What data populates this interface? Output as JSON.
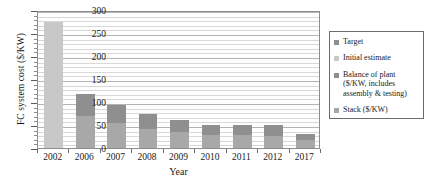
{
  "chart_data": {
    "type": "bar",
    "title": "",
    "xlabel": "Year",
    "ylabel": "FC system cost ($/KW)",
    "ylim": [
      0,
      300
    ],
    "yticks": [
      0,
      50,
      100,
      150,
      200,
      250,
      300
    ],
    "ytick_labels": [
      "0",
      "50",
      "100",
      "150",
      "200",
      "250",
      "300"
    ],
    "minor_tick_step": 10,
    "grid": true,
    "grid_axis": "y",
    "legend_position": "right",
    "stacked": true,
    "categories": [
      "2002",
      "2006",
      "2007",
      "2008",
      "2009",
      "2010",
      "2011",
      "2012",
      "2017"
    ],
    "series": [
      {
        "name": "Initial estimate",
        "color": "#c8c8c8",
        "values": [
          275,
          0,
          0,
          0,
          0,
          0,
          0,
          0,
          0
        ]
      },
      {
        "name": "Stack ($/KW)",
        "color": "#a8a8a8",
        "values": [
          0,
          70,
          55,
          41,
          34,
          29,
          29,
          27,
          18
        ]
      },
      {
        "name": "Balance of plant ($/KW, includes assembly & testing)",
        "color": "#8f8f8f",
        "values": [
          0,
          48,
          39,
          32,
          27,
          22,
          22,
          22,
          13
        ]
      }
    ],
    "totals": [
      275,
      118,
      94,
      73,
      61,
      51,
      51,
      49,
      31
    ],
    "legend_entries": [
      {
        "label": "Target",
        "color": "#8f8f8f"
      },
      {
        "label": "Initial estimate",
        "color": "#c8c8c8"
      },
      {
        "label": "Balance of plant",
        "label2": "($/KW, includes",
        "label3": "assembly & testing)",
        "color": "#8f8f8f"
      },
      {
        "label": "Stack ($/KW)",
        "color": "#a8a8a8"
      }
    ]
  },
  "axes": {
    "y_title": "FC system cost ($/KW)",
    "x_title": "Year"
  },
  "colors": {
    "bop": "#8f8f8f",
    "stack": "#a8a8a8",
    "initial": "#c8c8c8",
    "frame": "#8d8d8d",
    "grid": "#d8d8d8"
  }
}
